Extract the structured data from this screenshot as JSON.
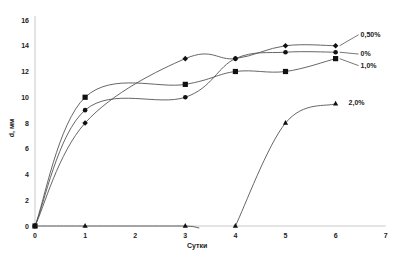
{
  "chart_data": {
    "type": "line",
    "title": "",
    "xlabel": "Сутки",
    "ylabel": "d, мм",
    "xlim": [
      0,
      7
    ],
    "ylim": [
      0,
      16
    ],
    "x_ticks": [
      0,
      1,
      2,
      3,
      4,
      5,
      6,
      7
    ],
    "y_ticks": [
      0,
      2,
      4,
      6,
      8,
      10,
      12,
      14,
      16
    ],
    "grid": false,
    "legend_position": "inline-right",
    "series": [
      {
        "name": "0,50%",
        "marker": "diamond",
        "x": [
          0,
          1,
          3,
          4,
          5,
          6
        ],
        "values": [
          0,
          8,
          13,
          13,
          14,
          14
        ],
        "label_y": 14.7
      },
      {
        "name": "0%",
        "marker": "circle",
        "x": [
          0,
          1,
          3,
          4,
          5,
          6
        ],
        "values": [
          0,
          9,
          10,
          13,
          13.5,
          13.5
        ],
        "label_y": 13.2
      },
      {
        "name": "1,0%",
        "marker": "square",
        "x": [
          0,
          1,
          3,
          4,
          5,
          6
        ],
        "values": [
          0,
          10,
          11,
          12,
          12,
          13
        ],
        "label_y": 12.3
      },
      {
        "name": "2,0%",
        "marker": "triangle",
        "x": [
          0,
          1,
          3,
          4,
          5,
          6
        ],
        "values": [
          0,
          0,
          0,
          0,
          8,
          9.5
        ],
        "label_y": 9.4,
        "break_after_index": 2
      }
    ]
  }
}
